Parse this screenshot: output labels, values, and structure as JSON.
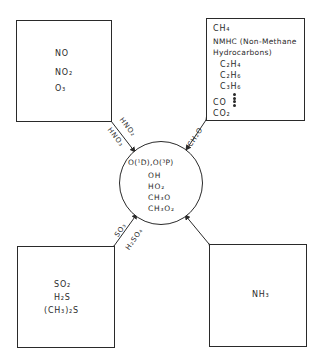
{
  "diagram": {
    "type": "atmospheric-chemistry-reservoir-diagram",
    "center": {
      "title": "O(¹D),O(³P)",
      "species": [
        "OH",
        "HO₂",
        "CH₃O",
        "CH₃O₂"
      ]
    },
    "boxes": {
      "nitrogen": {
        "species": [
          "NO",
          "NO₂",
          "O₃"
        ]
      },
      "carbon": {
        "species": [
          "CH₄",
          "NMHC (Non-Methane",
          "Hydrocarbons)",
          "C₂H₄",
          "C₂H₆",
          "C₃H₆",
          "CO",
          "CO₂"
        ]
      },
      "sulfur": {
        "species": [
          "SO₂",
          "H₂S",
          "(CH₃)₂S"
        ]
      },
      "ammonia": {
        "species": [
          "NH₃"
        ]
      }
    },
    "links": {
      "nitrogen_upper": "HNO₂",
      "nitrogen_lower": "HNO₃",
      "carbon": "CH₂O",
      "sulfur_upper": "SO₃",
      "sulfur_lower": "H₂SO₄",
      "ammonia": ""
    }
  }
}
